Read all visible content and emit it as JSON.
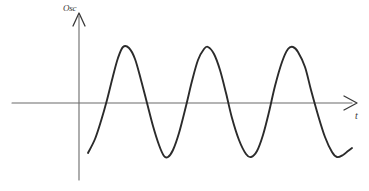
{
  "figure": {
    "background_color": "#ffffff",
    "width": 369,
    "height": 191,
    "curve_color": "#2b2b2b",
    "axis_color": "#6b6b6b",
    "label_color": "#3a3a3a"
  },
  "axes": {
    "y_axis": {
      "label": "Osc",
      "icon": "up-arrow-icon",
      "x_position": 79,
      "top": 12,
      "bottom": 180
    },
    "x_axis": {
      "label": "t",
      "icon": "right-arrow-icon",
      "y_position": 103,
      "left": 12,
      "right": 360
    }
  },
  "chart_data": {
    "type": "line",
    "title": "",
    "xlabel": "t",
    "ylabel": "Osc",
    "grid": false,
    "legend": null,
    "series": [
      {
        "name": "oscillation",
        "description": "Sinusoidal oscillation, approximately three full cycles, constant amplitude",
        "cycles": 3,
        "period_px": 85,
        "amplitude_px": 55,
        "baseline_y_px": 103,
        "peak_y_px": 47,
        "trough_y_px": 157,
        "start_point_px": [
          88,
          153
        ],
        "end_point_px": [
          352,
          148
        ],
        "peaks_x_px": [
          123,
          208,
          293
        ],
        "troughs_x_px": [
          166,
          251,
          336
        ],
        "zero_crossings_x_px": [
          101,
          144,
          186,
          229,
          271,
          314,
          356
        ],
        "points_px": [
          [
            88,
            153
          ],
          [
            95,
            139
          ],
          [
            101,
            121
          ],
          [
            107,
            100
          ],
          [
            113,
            76
          ],
          [
            118,
            58
          ],
          [
            123,
            47
          ],
          [
            129,
            48
          ],
          [
            135,
            59
          ],
          [
            141,
            80
          ],
          [
            147,
            103
          ],
          [
            153,
            126
          ],
          [
            159,
            145
          ],
          [
            164,
            156
          ],
          [
            168,
            157
          ],
          [
            173,
            150
          ],
          [
            179,
            133
          ],
          [
            186,
            106
          ],
          [
            192,
            81
          ],
          [
            198,
            60
          ],
          [
            204,
            49
          ],
          [
            208,
            47
          ],
          [
            214,
            54
          ],
          [
            220,
            70
          ],
          [
            226,
            93
          ],
          [
            232,
            118
          ],
          [
            239,
            140
          ],
          [
            246,
            154
          ],
          [
            251,
            157
          ],
          [
            257,
            151
          ],
          [
            263,
            135
          ],
          [
            269,
            112
          ],
          [
            275,
            86
          ],
          [
            282,
            62
          ],
          [
            288,
            49
          ],
          [
            293,
            47
          ],
          [
            298,
            52
          ],
          [
            305,
            67
          ],
          [
            311,
            90
          ],
          [
            318,
            115
          ],
          [
            325,
            137
          ],
          [
            332,
            152
          ],
          [
            337,
            157
          ],
          [
            343,
            155
          ],
          [
            348,
            151
          ],
          [
            352,
            148
          ]
        ]
      }
    ]
  }
}
